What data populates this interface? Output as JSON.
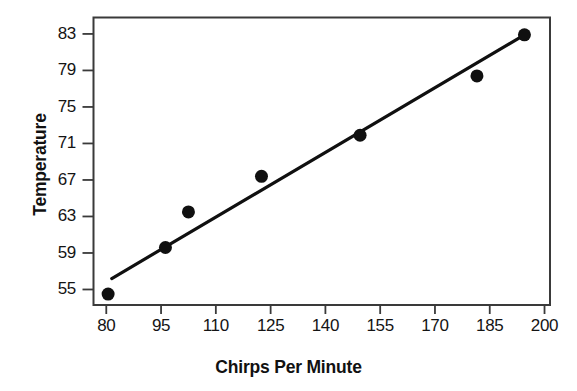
{
  "chart_data": {
    "type": "scatter",
    "title": "",
    "subtitle": "",
    "xlabel": "Chirps Per Minute",
    "ylabel": "Temperature",
    "xlim": [
      76.5,
      201.5
    ],
    "ylim": [
      53.3,
      84.8
    ],
    "xticks": [
      80,
      95,
      110,
      125,
      140,
      155,
      170,
      185,
      200
    ],
    "yticks": [
      55,
      59,
      63,
      67,
      71,
      75,
      79,
      83
    ],
    "xtick_labels": [
      "80",
      "95",
      "110",
      "125",
      "140",
      "155",
      "170",
      "185",
      "200"
    ],
    "ytick_labels": [
      "55",
      "59",
      "63",
      "67",
      "71",
      "75",
      "79",
      "83"
    ],
    "grid": false,
    "legend": null,
    "frame": true,
    "marker": {
      "shape": "circle",
      "color": "#101010",
      "size": 6.5
    },
    "series": [
      {
        "name": "Observations",
        "type": "scatter",
        "color": "#101010",
        "points": [
          {
            "x": 80.5,
            "y": 54.5
          },
          {
            "x": 96.2,
            "y": 59.6
          },
          {
            "x": 102.5,
            "y": 63.5
          },
          {
            "x": 122.5,
            "y": 67.4
          },
          {
            "x": 149.5,
            "y": 71.9
          },
          {
            "x": 181.5,
            "y": 78.4
          },
          {
            "x": 194.5,
            "y": 82.9
          }
        ]
      },
      {
        "name": "Trend Line",
        "type": "line",
        "color": "#101010",
        "width": 3.2,
        "endpoints": [
          {
            "x": 81.5,
            "y": 56.2
          },
          {
            "x": 194.5,
            "y": 82.9
          }
        ]
      }
    ]
  },
  "axes": {
    "x_title": "Chirps Per Minute",
    "y_title": "Temperature"
  },
  "colors": {
    "background": "#ffffff",
    "foreground": "#101010",
    "frame": "#3a3a3a"
  }
}
